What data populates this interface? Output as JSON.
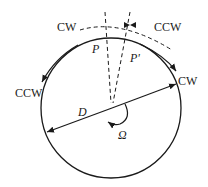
{
  "diagram": {
    "labels": {
      "cw_top_left": "CW",
      "ccw_top_right": "CCW",
      "ccw_left": "CCW",
      "cw_right": "CW",
      "p": "P",
      "p_prime": "P'",
      "diameter": "D",
      "omega": "Ω"
    },
    "colors": {
      "stroke": "#1a1a1a",
      "background": "#ffffff"
    }
  }
}
